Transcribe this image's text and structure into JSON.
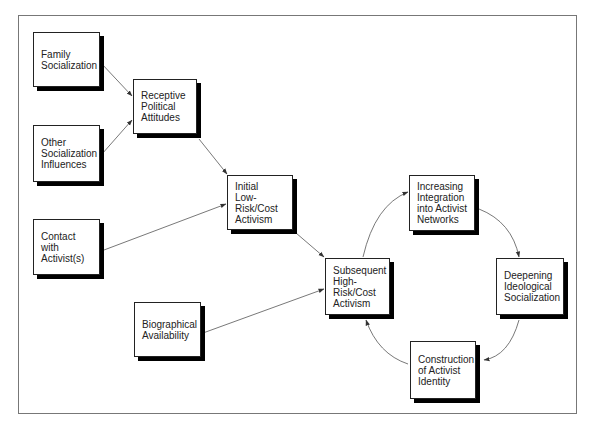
{
  "diagram": {
    "nodes": [
      {
        "id": "family",
        "lines": [
          "Family",
          "Socialization"
        ],
        "x": 33,
        "y": 32,
        "w": 67,
        "h": 55,
        "pad_top": 0
      },
      {
        "id": "other",
        "lines": [
          "Other",
          "Socialization",
          "Influences"
        ],
        "x": 33,
        "y": 125,
        "w": 67,
        "h": 57
      },
      {
        "id": "receptive",
        "lines": [
          "Receptive",
          "Political",
          "Attitudes"
        ],
        "x": 133,
        "y": 79,
        "w": 64,
        "h": 55
      },
      {
        "id": "contact",
        "lines": [
          "Contact",
          "with",
          "Activist(s)"
        ],
        "x": 33,
        "y": 219,
        "w": 67,
        "h": 56
      },
      {
        "id": "initial",
        "lines": [
          "Initial",
          "Low-",
          "Risk/Cost",
          "Activism"
        ],
        "x": 227,
        "y": 175,
        "w": 66,
        "h": 55
      },
      {
        "id": "biographical",
        "lines": [
          "Biographical",
          "Availability"
        ],
        "x": 134,
        "y": 302,
        "w": 67,
        "h": 55
      },
      {
        "id": "subsequent",
        "lines": [
          "Subsequent",
          "High-",
          "Risk/Cost",
          "Activism"
        ],
        "x": 325,
        "y": 258,
        "w": 65,
        "h": 57
      },
      {
        "id": "integration",
        "lines": [
          "Increasing",
          "Integration",
          "into Activist",
          "Networks"
        ],
        "x": 409,
        "y": 175,
        "w": 66,
        "h": 56
      },
      {
        "id": "deepening",
        "lines": [
          "Deepening",
          "Ideological",
          "Socialization"
        ],
        "x": 496,
        "y": 258,
        "w": 68,
        "h": 57
      },
      {
        "id": "construction",
        "lines": [
          "Construction",
          "of Activist",
          "Identity"
        ],
        "x": 410,
        "y": 341,
        "w": 66,
        "h": 58
      }
    ],
    "edges": [
      {
        "from": "family",
        "to": "receptive",
        "path": "M101,63 L132,96"
      },
      {
        "from": "other",
        "to": "receptive",
        "path": "M102,154 L132,120"
      },
      {
        "from": "receptive",
        "to": "initial",
        "path": "M199,139 L227,174"
      },
      {
        "from": "contact",
        "to": "initial",
        "path": "M104,250 L226,204"
      },
      {
        "from": "initial",
        "to": "subsequent",
        "path": "M296,233 L324,257"
      },
      {
        "from": "biographical",
        "to": "subsequent",
        "path": "M203,333 L324,289"
      },
      {
        "from": "subsequent",
        "to": "integration",
        "path": "M363,257 Q375,205 408,192"
      },
      {
        "from": "integration",
        "to": "deepening",
        "path": "M479,209 Q512,222 519,257"
      },
      {
        "from": "deepening",
        "to": "construction",
        "path": "M519,320 Q509,356 484,360"
      },
      {
        "from": "construction",
        "to": "subsequent",
        "path": "M408,364 Q378,354 366,320"
      }
    ]
  }
}
